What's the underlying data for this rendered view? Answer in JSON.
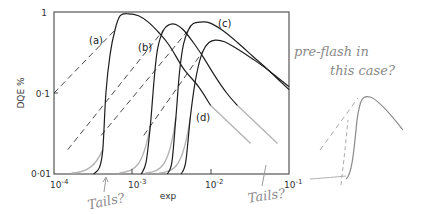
{
  "chart_data": {
    "type": "line",
    "title": "",
    "xlabel": "exp",
    "ylabel": "DQE %",
    "xscale": "log",
    "yscale": "log",
    "xlim": [
      0.0001,
      0.1
    ],
    "ylim": [
      0.01,
      1
    ],
    "x_ticks": [
      0.0001,
      0.001,
      0.01,
      0.1
    ],
    "x_tick_labels": [
      "10^-4",
      "10^-3",
      "10^-2",
      "10^-1"
    ],
    "y_ticks": [
      0.01,
      0.1,
      1
    ],
    "y_tick_labels": [
      "0·01",
      "0·1",
      "1"
    ],
    "grid": false,
    "legend": "inline labels",
    "series": [
      {
        "name": "(a)",
        "style": "solid",
        "x": [
          0.00032,
          0.00038,
          0.00042,
          0.00046,
          0.00052,
          0.0006,
          0.0007,
          0.0009,
          0.0012,
          0.0016,
          0.0022,
          0.003,
          0.0045,
          0.007,
          0.01
        ],
        "y": [
          0.01,
          0.012,
          0.02,
          0.1,
          0.3,
          0.6,
          0.9,
          0.95,
          0.9,
          0.75,
          0.55,
          0.38,
          0.2,
          0.12,
          0.07
        ]
      },
      {
        "name": "(b)",
        "style": "solid",
        "x": [
          0.0013,
          0.0015,
          0.0017,
          0.0019,
          0.0021,
          0.0025,
          0.003,
          0.0036,
          0.0045,
          0.006,
          0.008,
          0.011,
          0.016,
          0.022
        ],
        "y": [
          0.01,
          0.014,
          0.04,
          0.15,
          0.35,
          0.6,
          0.7,
          0.7,
          0.6,
          0.42,
          0.28,
          0.17,
          0.1,
          0.07
        ]
      },
      {
        "name": "(c)",
        "style": "solid",
        "x": [
          0.0028,
          0.0032,
          0.0036,
          0.004,
          0.0045,
          0.0052,
          0.006,
          0.0075,
          0.0095,
          0.014,
          0.022,
          0.035,
          0.055,
          0.1
        ],
        "y": [
          0.01,
          0.014,
          0.05,
          0.18,
          0.4,
          0.6,
          0.72,
          0.75,
          0.74,
          0.6,
          0.42,
          0.28,
          0.19,
          0.11
        ]
      },
      {
        "name": "(d)",
        "style": "solid",
        "x": [
          0.0042,
          0.0048,
          0.0055,
          0.0062,
          0.007,
          0.008,
          0.0095,
          0.0115,
          0.015,
          0.022,
          0.035,
          0.055,
          0.1
        ],
        "y": [
          0.01,
          0.014,
          0.05,
          0.12,
          0.22,
          0.33,
          0.42,
          0.45,
          0.43,
          0.35,
          0.26,
          0.19,
          0.12
        ]
      },
      {
        "name": "(a) asymptote",
        "style": "dashed",
        "x": [
          0.0001,
          0.0006
        ],
        "y": [
          0.1,
          0.6
        ]
      },
      {
        "name": "(b) asymptote",
        "style": "dashed",
        "x": [
          0.00015,
          0.0025
        ],
        "y": [
          0.02,
          0.6
        ]
      },
      {
        "name": "(c) asymptote",
        "style": "dashed",
        "x": [
          0.0004,
          0.0052
        ],
        "y": [
          0.03,
          0.6
        ]
      },
      {
        "name": "(d) asymptote",
        "style": "dashed",
        "x": [
          0.0014,
          0.008
        ],
        "y": [
          0.03,
          0.33
        ]
      }
    ],
    "annotations": [
      {
        "text": "(a)",
        "x": 0.00026,
        "y": 0.55
      },
      {
        "text": "(b)",
        "x": 0.0011,
        "y": 0.35
      },
      {
        "text": "(c)",
        "x": 0.011,
        "y": 0.7
      },
      {
        "text": "(d)",
        "x": 0.0068,
        "y": 0.05
      },
      {
        "text": "Tails?",
        "handwritten": true,
        "near": "below x-axis near 2e-4"
      },
      {
        "text": "Tails?",
        "handwritten": true,
        "near": "below x-axis near 4e-2"
      },
      {
        "text": "pre-flash in this case?",
        "handwritten": true,
        "near": "right of plot"
      }
    ]
  },
  "labels": {
    "ylabel": "DQE %",
    "xlabel": "exp",
    "y_ticks": [
      "1",
      "0·1",
      "0·01"
    ],
    "x_ticks_base": [
      "10",
      "10",
      "10",
      "10"
    ],
    "x_ticks_exp": [
      "-4",
      "-3",
      "-2",
      "-1"
    ],
    "curves": [
      "(a)",
      "(b)",
      "(c)",
      "(d)"
    ],
    "notes": {
      "tails_left": "Tails?",
      "tails_right": "Tails?",
      "preflash_line1": "pre-flash in",
      "preflash_line2": "this case?"
    }
  },
  "colors": {
    "ink": "#1e1e1e",
    "frame": "#444444",
    "pencil": "#9a9a9a"
  }
}
